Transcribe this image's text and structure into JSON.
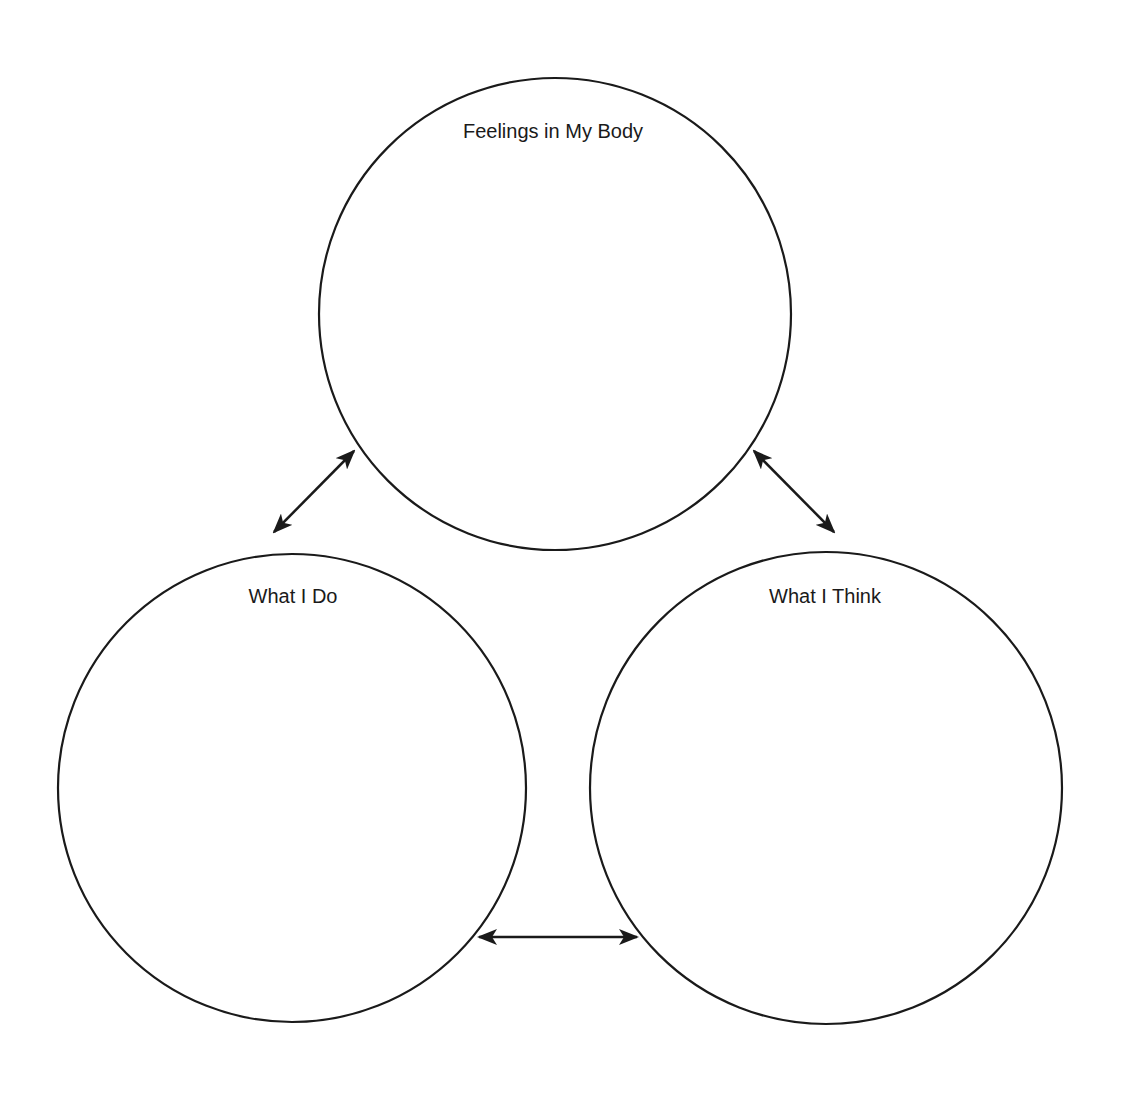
{
  "diagram": {
    "stroke_color": "#1a1a1a",
    "background": "#ffffff",
    "nodes": [
      {
        "id": "body",
        "label": "Feelings in My Body",
        "cx": 555,
        "cy": 314,
        "r": 236,
        "label_x": 553,
        "label_y": 138
      },
      {
        "id": "do",
        "label": "What I Do",
        "cx": 292,
        "cy": 788,
        "r": 234,
        "label_x": 293,
        "label_y": 603
      },
      {
        "id": "think",
        "label": "What I Think",
        "cx": 826,
        "cy": 788,
        "r": 236,
        "label_x": 825,
        "label_y": 603
      }
    ],
    "edges": [
      {
        "from": "do",
        "to": "body",
        "type": "bidirectional",
        "x1": 274,
        "y1": 532,
        "x2": 354,
        "y2": 451
      },
      {
        "from": "body",
        "to": "think",
        "type": "bidirectional",
        "x1": 754,
        "y1": 451,
        "x2": 834,
        "y2": 532
      },
      {
        "from": "do",
        "to": "think",
        "type": "bidirectional",
        "x1": 479,
        "y1": 937,
        "x2": 637,
        "y2": 937
      }
    ]
  }
}
